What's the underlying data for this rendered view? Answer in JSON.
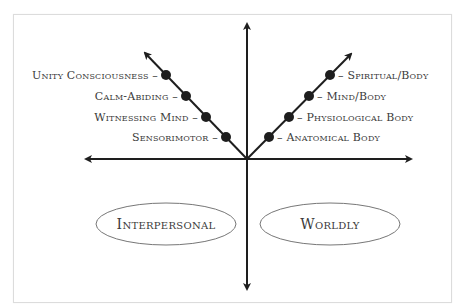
{
  "diagram": {
    "left_diagonal": {
      "labels": [
        "Unity Consciousness –",
        "Calm-Abiding –",
        "Witnessing Mind –",
        "Sensorimotor –"
      ]
    },
    "right_diagonal": {
      "labels": [
        "– Spiritual/Body",
        "– Mind/Body",
        "– Physiological Body",
        "– Anatomical Body"
      ]
    },
    "quadrants": {
      "left": "Interpersonal",
      "right": "Worldly"
    },
    "colors": {
      "line": "#1e1e1e",
      "dot": "#1e1e1e",
      "text": "#3a3a3a",
      "ellipse": "#777777"
    }
  }
}
